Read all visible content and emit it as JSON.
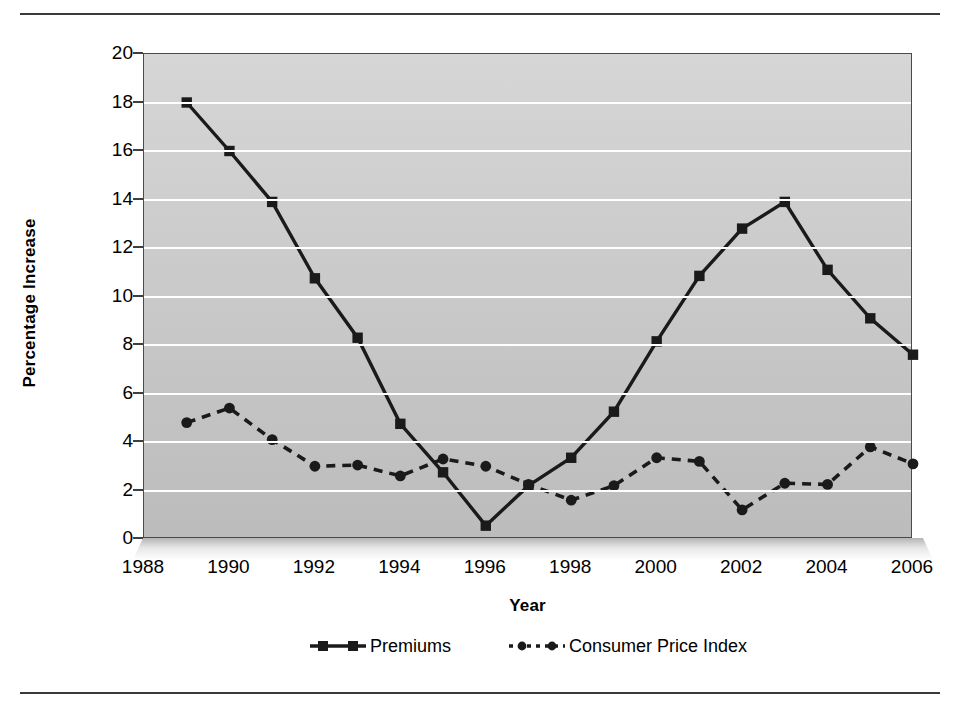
{
  "chart_data": {
    "type": "line",
    "title": "",
    "xlabel": "Year",
    "ylabel": "Percentage Increase",
    "xlim": [
      1988,
      2006
    ],
    "ylim": [
      0,
      20
    ],
    "ytick_step": 2,
    "yticks": [
      20,
      18,
      16,
      14,
      12,
      10,
      8,
      6,
      4,
      2,
      0
    ],
    "xticks": [
      1988,
      1990,
      1992,
      1994,
      1996,
      1998,
      2000,
      2002,
      2004,
      2006
    ],
    "grid": "horizontal",
    "legend_position": "bottom",
    "plot_background": "#cdcdcd",
    "gridline_color": "#ffffff",
    "series": [
      {
        "name": "Premiums",
        "marker": "square",
        "line_style": "solid",
        "color": "#1a1a1a",
        "x": [
          1989,
          1990,
          1991,
          1992,
          1993,
          1994,
          1995,
          1996,
          1997,
          1998,
          1999,
          2000,
          2001,
          2002,
          2003,
          2004,
          2005,
          2006
        ],
        "values": [
          18.0,
          16.0,
          13.9,
          10.75,
          8.3,
          4.75,
          2.75,
          0.55,
          2.2,
          3.35,
          5.25,
          8.15,
          10.85,
          12.8,
          13.9,
          11.1,
          9.1,
          7.6
        ]
      },
      {
        "name": "Consumer Price Index",
        "marker": "circle",
        "line_style": "dashed",
        "color": "#1a1a1a",
        "x": [
          1989,
          1990,
          1991,
          1992,
          1993,
          1994,
          1995,
          1996,
          1997,
          1998,
          1999,
          2000,
          2001,
          2002,
          2003,
          2004,
          2005,
          2006
        ],
        "values": [
          4.8,
          5.4,
          4.1,
          3.0,
          3.05,
          2.6,
          3.3,
          3.0,
          2.25,
          1.6,
          2.2,
          3.35,
          3.2,
          1.2,
          2.3,
          2.25,
          3.8,
          3.1
        ]
      }
    ]
  },
  "legend": {
    "items": [
      {
        "label": "Premiums"
      },
      {
        "label": "Consumer Price Index"
      }
    ]
  }
}
